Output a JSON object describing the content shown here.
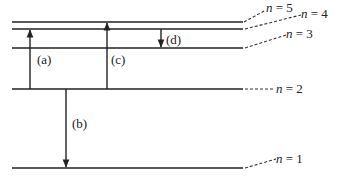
{
  "diagram": {
    "levels": [
      {
        "n": 5,
        "label_n": "n",
        "label_eq": " = 5",
        "y": 22,
        "label_x": 265,
        "label_y": 12
      },
      {
        "n": 4,
        "label_n": "n",
        "label_eq": " = 4",
        "y": 29,
        "label_x": 300,
        "label_y": 17
      },
      {
        "n": 3,
        "label_n": "n",
        "label_eq": " = 3",
        "y": 48,
        "label_x": 285,
        "label_y": 37
      },
      {
        "n": 2,
        "label_n": "n",
        "label_eq": " = 2",
        "y": 89,
        "label_x": 275,
        "label_y": 93
      },
      {
        "n": 1,
        "label_n": "n",
        "label_eq": " = 1",
        "y": 168,
        "label_x": 275,
        "label_y": 162
      }
    ],
    "transitions": [
      {
        "id": "a",
        "label": "(a)",
        "from": 2,
        "to": 4,
        "x": 30,
        "direction": "up"
      },
      {
        "id": "b",
        "label": "(b)",
        "from": 2,
        "to": 1,
        "x": 66,
        "direction": "down"
      },
      {
        "id": "c",
        "label": "(c)",
        "from": 2,
        "to": 5,
        "x": 107,
        "direction": "up"
      },
      {
        "id": "d",
        "label": "(d)",
        "from": 4,
        "to": 3,
        "x": 161,
        "direction": "down"
      }
    ]
  }
}
